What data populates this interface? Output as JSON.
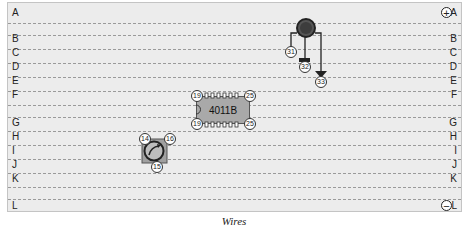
{
  "board": {
    "rows_left": [
      {
        "label": "A",
        "y": 13
      },
      {
        "label": "B",
        "y": 38
      },
      {
        "label": "C",
        "y": 52
      },
      {
        "label": "D",
        "y": 66
      },
      {
        "label": "E",
        "y": 80
      },
      {
        "label": "F",
        "y": 94
      },
      {
        "label": "G",
        "y": 122
      },
      {
        "label": "H",
        "y": 136
      },
      {
        "label": "I",
        "y": 150
      },
      {
        "label": "J",
        "y": 164
      },
      {
        "label": "K",
        "y": 178
      },
      {
        "label": "L",
        "y": 204
      }
    ],
    "positive_rail_symbol": "+",
    "negative_rail_symbol": "−"
  },
  "components": {
    "ic": {
      "label": "4011B",
      "pins": {
        "top_left": "19",
        "top_right": "25",
        "bottom_left": "19",
        "bottom_right": "25"
      }
    },
    "potentiometer": {
      "pins": {
        "left": "14",
        "right": "16",
        "bottom": "15"
      }
    },
    "led": {
      "pins": {
        "left": "31",
        "middle": "32",
        "right": "33"
      }
    }
  },
  "caption": "Wires"
}
